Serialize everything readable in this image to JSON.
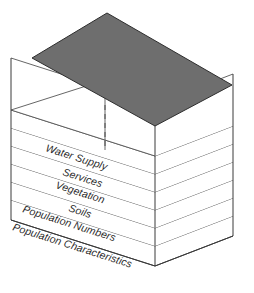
{
  "figure": {
    "top_face_color": "#6e6e6e",
    "slab_face_color": "#ffffff",
    "outline_color": "#3a3a3a",
    "hidden_edge_style": "dashed"
  },
  "layers": [
    {
      "id": "layer-water-supply",
      "label": "Water Supply"
    },
    {
      "id": "layer-services",
      "label": "Services"
    },
    {
      "id": "layer-vegetation",
      "label": "Vegetation"
    },
    {
      "id": "layer-soils",
      "label": "Soils"
    },
    {
      "id": "layer-population-numbers",
      "label": "Population Numbers"
    },
    {
      "id": "layer-population-characteristics",
      "label": "Population Characteristics"
    }
  ]
}
